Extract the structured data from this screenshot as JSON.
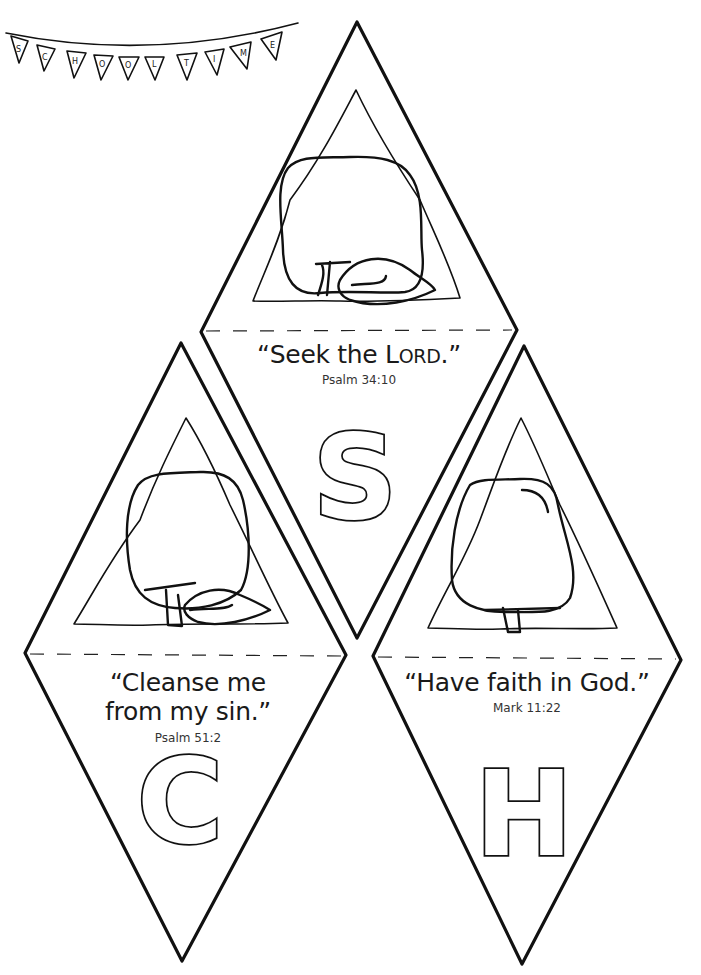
{
  "bunting": {
    "letters": [
      "S",
      "C",
      "H",
      "O",
      "O",
      "L",
      "T",
      "I",
      "M",
      "E"
    ]
  },
  "pennants": [
    {
      "letter": "S",
      "verse": "“Seek the ",
      "verse_smallcaps_L": "L",
      "verse_smallcaps_rest": "ORD",
      "verse_end": ".”",
      "reference": "Psalm 34:10"
    },
    {
      "letter": "C",
      "verse_line1": "“Cleanse me",
      "verse_line2": "from my sin.”",
      "reference": "Psalm 51:2"
    },
    {
      "letter": "H",
      "verse": "“Have faith in God.”",
      "reference": "Mark 11:22"
    }
  ],
  "colors": {
    "ink": "#111111",
    "paper": "#ffffff"
  }
}
